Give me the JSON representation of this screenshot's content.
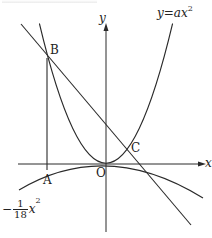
{
  "figure": {
    "title": "",
    "axes": {
      "x_label": "x",
      "y_label": "y",
      "origin_label": "O"
    },
    "curves": {
      "upper_parabola_label": {
        "lhs": "y",
        "eq": "=",
        "coef": "a",
        "var": "x",
        "exp": "2"
      },
      "lower_parabola_label": {
        "sign": "−",
        "num": "1",
        "den": "18",
        "var": "x",
        "exp": "2"
      }
    },
    "points": {
      "A": "A",
      "B": "B",
      "C": "C",
      "O": "O"
    },
    "colors": {
      "stroke": "#2a2a2a",
      "background": "#ffffff"
    }
  }
}
